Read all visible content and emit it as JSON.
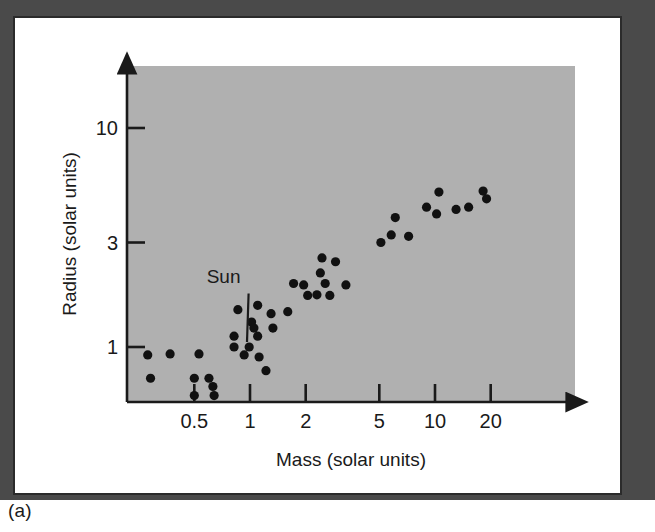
{
  "figure": {
    "caption": "(a)",
    "panel_fill": "#b0b0b0",
    "frame_fill": "#ffffff",
    "bevel_color": "#4a4a4a",
    "ink_color": "#1a1a1a"
  },
  "chart_data": {
    "type": "scatter",
    "title": "",
    "xlabel": "Mass (solar units)",
    "ylabel": "Radius (solar units)",
    "xscale": "log",
    "yscale": "log",
    "xlim": [
      0.22,
      34
    ],
    "ylim": [
      0.48,
      21
    ],
    "grid": false,
    "legend": null,
    "xticks": [
      0.5,
      1,
      2,
      5,
      10,
      20
    ],
    "xtick_labels": [
      "0.5",
      "1",
      "2",
      "5",
      "10",
      "20"
    ],
    "yticks": [
      1,
      3,
      10
    ],
    "ytick_labels": [
      "1",
      "3",
      "10"
    ],
    "annotations": [
      {
        "text": "Sun",
        "point_x": 1.0,
        "point_y": 1.0,
        "label_x": 0.72,
        "label_y": 1.95
      }
    ],
    "series": [
      {
        "name": "Main-sequence stars",
        "marker": "circle",
        "color": "#111111",
        "points": [
          [
            0.28,
            0.92
          ],
          [
            0.29,
            0.72
          ],
          [
            0.37,
            0.93
          ],
          [
            0.5,
            0.72
          ],
          [
            0.5,
            0.6
          ],
          [
            0.53,
            0.93
          ],
          [
            0.6,
            0.72
          ],
          [
            0.63,
            0.66
          ],
          [
            0.64,
            0.6
          ],
          [
            0.82,
            1.12
          ],
          [
            0.82,
            1.0
          ],
          [
            0.86,
            1.48
          ],
          [
            0.93,
            0.92
          ],
          [
            0.99,
            1.0
          ],
          [
            1.02,
            1.3
          ],
          [
            1.05,
            1.22
          ],
          [
            1.1,
            1.55
          ],
          [
            1.1,
            1.12
          ],
          [
            1.12,
            0.9
          ],
          [
            1.22,
            0.78
          ],
          [
            1.3,
            1.42
          ],
          [
            1.33,
            1.22
          ],
          [
            1.6,
            1.45
          ],
          [
            1.72,
            1.95
          ],
          [
            1.95,
            1.92
          ],
          [
            2.05,
            1.72
          ],
          [
            2.3,
            1.73
          ],
          [
            2.4,
            2.18
          ],
          [
            2.45,
            2.55
          ],
          [
            2.55,
            1.95
          ],
          [
            2.7,
            1.72
          ],
          [
            2.9,
            2.45
          ],
          [
            3.3,
            1.92
          ],
          [
            5.1,
            3.0
          ],
          [
            5.8,
            3.25
          ],
          [
            6.1,
            3.9
          ],
          [
            7.2,
            3.2
          ],
          [
            9.0,
            4.35
          ],
          [
            10.2,
            4.05
          ],
          [
            10.5,
            5.1
          ],
          [
            13.0,
            4.25
          ],
          [
            15.2,
            4.35
          ],
          [
            18.2,
            5.15
          ],
          [
            19.0,
            4.75
          ]
        ]
      }
    ]
  }
}
